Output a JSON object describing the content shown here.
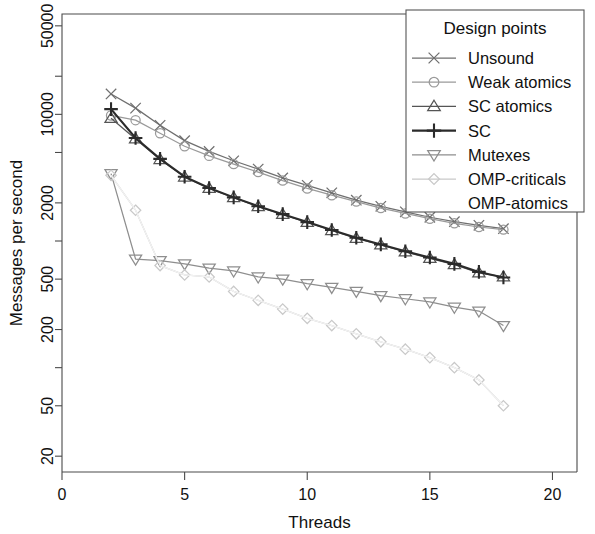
{
  "chart_data": {
    "type": "line",
    "title": "",
    "xlabel": "Threads",
    "ylabel": "Messages per second",
    "xlim": [
      0,
      21
    ],
    "ylim": [
      15,
      62000
    ],
    "yscale": "log",
    "xscale": "linear",
    "grid": false,
    "legend": {
      "title": "Design points",
      "position": "top-right",
      "entries": [
        {
          "label": "Unsound",
          "marker": "x-cross",
          "color": "#6f6f6f"
        },
        {
          "label": "Weak atomics",
          "marker": "circle",
          "color": "#9a9a9a"
        },
        {
          "label": "SC atomics",
          "marker": "triangle-up",
          "color": "#555555"
        },
        {
          "label": "SC",
          "marker": "plus",
          "color": "#2b2b2b"
        },
        {
          "label": "Mutexes",
          "marker": "triangle-down",
          "color": "#8e8e8e"
        },
        {
          "label": "OMP-criticals",
          "marker": "diamond",
          "color": "#c9c9c9"
        },
        {
          "label": "OMP-atomics",
          "marker": "none",
          "color": "#eeeeee"
        }
      ]
    },
    "xticks": [
      0,
      5,
      10,
      15,
      20
    ],
    "xtick_labels": [
      "0",
      "5",
      "10",
      "15",
      "20"
    ],
    "yticks": [
      20,
      50,
      200,
      500,
      2000,
      10000,
      50000
    ],
    "ytick_labels": [
      "20",
      "50",
      "200",
      "500",
      "2000",
      "10000",
      "50000"
    ],
    "yminor_ticks": [
      100,
      1000,
      5000,
      20000
    ],
    "x": [
      2,
      3,
      4,
      5,
      6,
      7,
      8,
      9,
      10,
      11,
      12,
      13,
      14,
      15,
      16,
      17,
      18
    ],
    "series": [
      {
        "name": "Unsound",
        "marker": "x-cross",
        "color": "#6f6f6f",
        "values": [
          14500,
          11200,
          8200,
          6200,
          5100,
          4300,
          3700,
          3150,
          2750,
          2400,
          2100,
          1880,
          1700,
          1540,
          1420,
          1330,
          1250
        ]
      },
      {
        "name": "Weak atomics",
        "marker": "circle",
        "color": "#9a9a9a",
        "values": [
          9800,
          9000,
          7100,
          5600,
          4700,
          4050,
          3500,
          3000,
          2600,
          2300,
          2050,
          1820,
          1650,
          1500,
          1380,
          1290,
          1230
        ]
      },
      {
        "name": "SC atomics",
        "marker": "triangle-up",
        "color": "#555555",
        "values": [
          9300,
          6400,
          4400,
          3200,
          2600,
          2200,
          1870,
          1620,
          1400,
          1210,
          1050,
          930,
          820,
          730,
          650,
          560,
          520
        ]
      },
      {
        "name": "SC",
        "marker": "plus",
        "color": "#2b2b2b",
        "values": [
          11000,
          6500,
          4450,
          3220,
          2620,
          2210,
          1880,
          1630,
          1410,
          1220,
          1060,
          940,
          830,
          740,
          660,
          570,
          515
        ]
      },
      {
        "name": "Mutexes",
        "marker": "triangle-down",
        "color": "#8e8e8e",
        "values": [
          3400,
          720,
          700,
          660,
          610,
          580,
          520,
          500,
          460,
          430,
          400,
          370,
          350,
          330,
          300,
          280,
          215
        ]
      },
      {
        "name": "OMP-criticals",
        "marker": "diamond",
        "color": "#c9c9c9",
        "values": [
          3300,
          1750,
          640,
          540,
          520,
          400,
          340,
          290,
          245,
          215,
          185,
          160,
          140,
          120,
          100,
          80,
          50
        ]
      },
      {
        "name": "OMP-atomics",
        "marker": "none",
        "color": "#f2f2f2",
        "values": [
          3300,
          1750,
          640,
          540,
          520,
          400,
          340,
          290,
          245,
          215,
          185,
          160,
          140,
          120,
          100,
          80,
          50
        ]
      }
    ]
  }
}
